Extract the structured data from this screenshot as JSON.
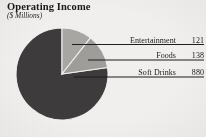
{
  "figure": {
    "title": "Operating Income",
    "subtitle": "($ Millions)",
    "background_color": "#f3f1ef"
  },
  "chart_data": {
    "type": "pie",
    "title": "Operating Income",
    "subtitle": "($ Millions)",
    "unit": "$ Millions",
    "categories": [
      "Entertainment",
      "Foods",
      "Soft Drinks"
    ],
    "values": [
      121,
      138,
      880
    ],
    "total": 1139,
    "percentages": [
      10.6,
      12.1,
      77.3
    ],
    "colors": [
      "#a9a7a4",
      "#a09e9b",
      "#3c3b3a"
    ],
    "start_angle_deg": 0,
    "direction": "clockwise",
    "legend": "leader-line labels, right side",
    "grid": false,
    "labels": [
      {
        "name": "Entertainment",
        "value": "121"
      },
      {
        "name": "Foods",
        "value": "138"
      },
      {
        "name": "Soft Drinks",
        "value": "880"
      }
    ]
  },
  "labels": {
    "entertainment": {
      "name": "Entertainment",
      "value": "121"
    },
    "foods": {
      "name": "Foods",
      "value": "138"
    },
    "soft_drinks": {
      "name": "Soft Drinks",
      "value": "880"
    }
  }
}
